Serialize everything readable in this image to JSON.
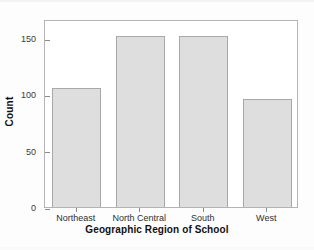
{
  "chart_data": {
    "type": "bar",
    "title": "",
    "categories": [
      "Northeast",
      "North Central",
      "South",
      "West"
    ],
    "values": [
      106,
      152,
      152,
      96
    ],
    "xlabel": "Geographic Region of School",
    "ylabel": "Count",
    "ylim": [
      0,
      167
    ],
    "yticks": [
      0,
      50,
      100,
      150
    ],
    "ytick_labels": [
      "0",
      "50",
      "100",
      "150"
    ],
    "grid": false,
    "legend": false,
    "bar_color": "#dedede",
    "bar_edge_color": "#a8a8a8",
    "frame_color": "#b4b4b4",
    "background": "#ffffff"
  }
}
